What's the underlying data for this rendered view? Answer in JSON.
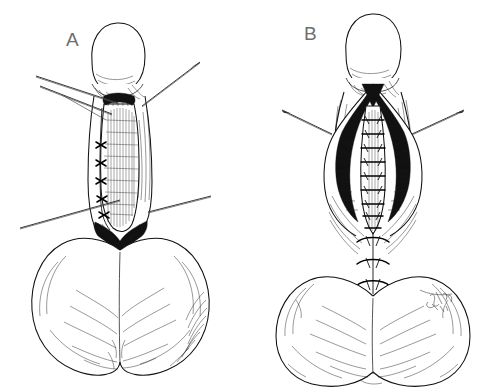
{
  "figure": {
    "kind": "line-drawing",
    "medium": "pen-and-ink medical illustration",
    "background_color": "#ffffff",
    "ink_color": "#111111",
    "width": 481,
    "height": 388,
    "border": "none",
    "caption_text": "",
    "title_text": ""
  },
  "panels": [
    {
      "id": "a",
      "label": "A",
      "label_color": "#6e6e6e",
      "label_x": 66,
      "label_y": 30,
      "subject": "penis-and-scrotum-ventral-view",
      "stage": "open-incision-with-running-suture-on-one-edge",
      "features": {
        "glans": "bulbous-tip-upper-center",
        "shaft_incision": "vertical-midline-open-wound",
        "suture_line_side": "left-edge-of-incision",
        "suture_knot_count": 5,
        "scrotum": "large-bilobed-mass-lower-half",
        "retractor_count": 4
      },
      "retractors": [
        {
          "name": "retractor-upper-left-1",
          "x1": 36,
          "y1": 76,
          "x2": 118,
          "y2": 103
        },
        {
          "name": "retractor-upper-left-2",
          "x1": 40,
          "y1": 86,
          "x2": 112,
          "y2": 114
        },
        {
          "name": "retractor-upper-right",
          "x1": 200,
          "y1": 62,
          "x2": 142,
          "y2": 106
        },
        {
          "name": "retractor-lower-left",
          "x1": 20,
          "y1": 228,
          "x2": 120,
          "y2": 200
        },
        {
          "name": "retractor-lower-right",
          "x1": 211,
          "y1": 196,
          "x2": 148,
          "y2": 212
        }
      ]
    },
    {
      "id": "b",
      "label": "B",
      "label_color": "#6e6e6e",
      "label_x": 304,
      "label_y": 24,
      "subject": "penis-and-scrotum-ventral-view",
      "stage": "deep-dissection-with-ladder-sutures-and-closed-scrotal-sutures",
      "features": {
        "glans": "bulbous-tip-upper-center",
        "shaft_incision": "wide-open-dissection-with-dark-shading",
        "ladder_suture_count": 9,
        "transverse_scrotal_suture_count": 3,
        "scrotum": "large-bilobed-mass-lower-half",
        "retractor_count": 2,
        "signature": "illegible-artist-signature-lower-right"
      },
      "retractors": [
        {
          "name": "retractor-left",
          "x1": 282,
          "y1": 110,
          "x2": 332,
          "y2": 134
        },
        {
          "name": "retractor-right",
          "x1": 464,
          "y1": 110,
          "x2": 412,
          "y2": 134
        }
      ],
      "transverse_sutures": [
        {
          "name": "scrotal-suture-1",
          "y": 240
        },
        {
          "name": "scrotal-suture-2",
          "y": 262
        },
        {
          "name": "scrotal-suture-3",
          "y": 284
        }
      ]
    }
  ],
  "signature": {
    "name": "artist-signature",
    "text": "",
    "x": 436,
    "y": 300,
    "legible": false
  }
}
